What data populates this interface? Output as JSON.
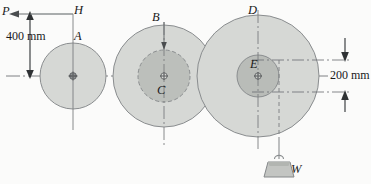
{
  "figure": {
    "type": "engineering-diagram",
    "background_color": "#fbfbfa",
    "labels": {
      "P": "P",
      "H": "H",
      "A": "A",
      "B": "B",
      "C": "C",
      "D": "D",
      "E": "E",
      "W": "W"
    },
    "dimensions": {
      "vertical_left": "400 mm",
      "vertical_right": "200 mm"
    },
    "colors": {
      "outline": "#8a8d8f",
      "disk_fill": "#d4d6d3",
      "inner_disk_fill": "#b9bcb8",
      "centerline": "#6f7376",
      "force_line": "#6b6e70",
      "weight_fill": "#c3c5c2",
      "text": "#1a1a1a"
    },
    "geometry": {
      "centerline_y": 76,
      "circles": [
        {
          "name": "A",
          "cx": 73,
          "cy": 76,
          "r": 33,
          "style": "solid"
        },
        {
          "name": "B",
          "cx": 164,
          "cy": 76,
          "r": 51,
          "style": "solid"
        },
        {
          "name": "C",
          "cx": 164,
          "cy": 76,
          "r": 26,
          "style": "dashed"
        },
        {
          "name": "D",
          "cx": 258,
          "cy": 76,
          "r": 61,
          "style": "solid"
        },
        {
          "name": "E",
          "cx": 258,
          "cy": 76,
          "r": 21,
          "style": "solid"
        }
      ],
      "force_arrow_P": {
        "direction": "left",
        "y": 14,
        "from_x": 73,
        "to_x": 10
      },
      "dim_400_x": 30,
      "dim_400_span": [
        13,
        76
      ],
      "dim_200_x": 345,
      "dim_200_span": [
        60,
        92
      ],
      "weight_cord_x": 279,
      "weight_cx": 279,
      "weight_top_y": 158
    }
  }
}
